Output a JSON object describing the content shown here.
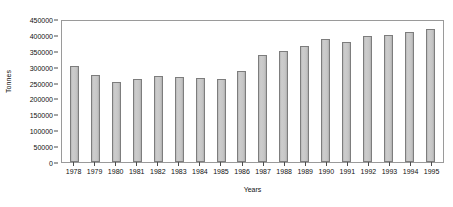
{
  "chart_data": {
    "type": "bar",
    "title": "",
    "xlabel": "Years",
    "ylabel": "Tonnes",
    "categories": [
      "1978",
      "1979",
      "1980",
      "1981",
      "1982",
      "1983",
      "1984",
      "1985",
      "1986",
      "1987",
      "1988",
      "1989",
      "1990",
      "1991",
      "1992",
      "1993",
      "1994",
      "1995"
    ],
    "values": [
      305000,
      278000,
      256000,
      264000,
      276000,
      272000,
      268000,
      264000,
      291000,
      340000,
      355000,
      371000,
      392000,
      382000,
      402000,
      404000,
      415000,
      424000
    ],
    "ylim": [
      0,
      450000
    ],
    "ytick_labels": [
      "0",
      "50000",
      "100000",
      "150000",
      "200000",
      "250000",
      "300000",
      "350000",
      "400000",
      "450000"
    ],
    "ytick_values": [
      0,
      50000,
      100000,
      150000,
      200000,
      250000,
      300000,
      350000,
      400000,
      450000
    ],
    "grid": false,
    "legend": "none",
    "bar_fill_color": "#c6c6c6",
    "bar_border_color": "#7d7d7d",
    "axis_color": "#9a9a9a",
    "text_color": "#111111"
  }
}
